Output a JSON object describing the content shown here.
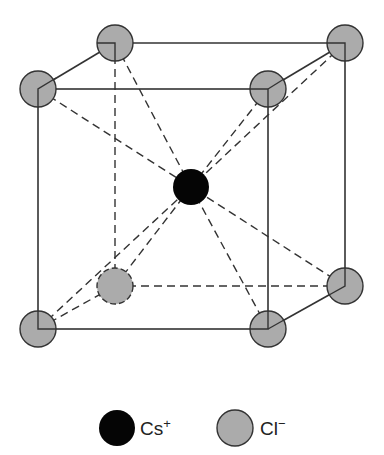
{
  "diagram": {
    "colors": {
      "cs": "#050505",
      "cl": "#ababab",
      "stroke": "#333333"
    },
    "legend": [
      {
        "symbol": "Cs",
        "charge": "+",
        "ion": "cs"
      },
      {
        "symbol": "Cl",
        "charge": "−",
        "ion": "cl"
      }
    ]
  }
}
